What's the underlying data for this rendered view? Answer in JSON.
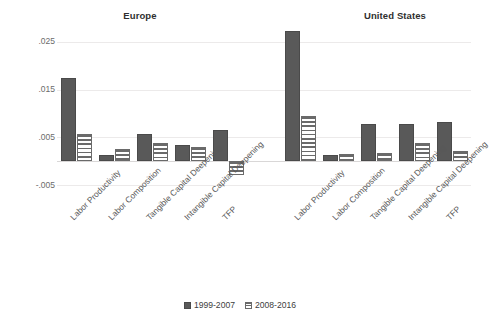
{
  "chart_data": {
    "type": "bar",
    "title": "",
    "panels": [
      {
        "title": "Europe",
        "categories": [
          "Labor Productivity",
          "Labor Composition",
          "Tangible Capital Deepening",
          "Intangible Capital Deepening",
          "TFP"
        ],
        "series": [
          {
            "name": "1999-2007",
            "values": [
              0.0175,
              0.0013,
              0.0057,
              0.0035,
              0.0065
            ]
          },
          {
            "name": "2008-2016",
            "values": [
              0.0057,
              0.0025,
              0.0038,
              0.003,
              -0.003
            ]
          }
        ]
      },
      {
        "title": "United States",
        "categories": [
          "Labor Productivity",
          "Labor Composition",
          "Tangible Capital Deepening",
          "Intangible Capital Deepening",
          "TFP"
        ],
        "series": [
          {
            "name": "1999-2007",
            "values": [
              0.0272,
              0.0013,
              0.0078,
              0.0078,
              0.0082
            ]
          },
          {
            "name": "2008-2016",
            "values": [
              0.0095,
              0.0015,
              0.0018,
              0.0038,
              0.0022
            ]
          }
        ]
      }
    ],
    "xlabel": "",
    "ylabel": "",
    "ylim": [
      -0.005,
      0.0275
    ],
    "yticks": [
      0.025,
      0.015,
      0.005,
      -0.005
    ],
    "ytick_labels": [
      ".025",
      ".015",
      ".005",
      "-.005"
    ],
    "grid": true,
    "legend": [
      "1999-2007",
      "2008-2016"
    ],
    "legend_position": "bottom",
    "colors": {
      "series_1": "#595959",
      "series_2": "#ffffff",
      "hatch": "#6a6a6a",
      "grid": "#eceaea"
    }
  },
  "legend": {
    "entries": [
      {
        "label": "1999-2007",
        "style": "solid"
      },
      {
        "label": "2008-2016",
        "style": "hatch"
      }
    ]
  }
}
